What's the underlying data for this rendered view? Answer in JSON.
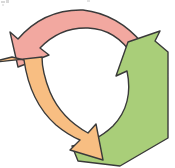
{
  "figure": {
    "type": "cycle-diagram",
    "background_color": "#ffffff",
    "outline_color": "#3a3a3a",
    "outline_width": 1.4,
    "rotation_direction": "counter-clockwise",
    "center": {
      "x": 88,
      "y": 85
    },
    "inner_radius": 48,
    "outer_radius": 82,
    "arrow_count": 3,
    "labels_present": false,
    "cropped_edges": [
      "left"
    ]
  },
  "arrows": [
    {
      "name": "pink-arrow",
      "position": "top",
      "fill": "#f2a8a0",
      "stroke": "#3a3a3a",
      "arrowhead_direction": "down-left",
      "tail_position": "upper-right",
      "path": "M 163 84 L 150 36 L 143 44 Q 118 14 83 10 Q 44 9 18 39 L 10 32 L 18 67 L 49 55 L 40 48 Q 60 27 88 28 Q 116 29 133 56 L 124 63 Z"
    },
    {
      "name": "green-arrow",
      "position": "right",
      "fill": "#a9ce79",
      "stroke": "#3a3a3a",
      "arrowhead_direction": "up-left",
      "tail_position": "bottom-left",
      "path": "M 128 42 L 116 76 L 127 71 Q 134 104 113 126 Q 95 143 72 146 L 78 161 L 120 166 L 168 138 L 168 52 L 155 41 L 160 31 Z"
    },
    {
      "name": "orange-arrow",
      "position": "left",
      "fill": "#f8be82",
      "stroke": "#3a3a3a",
      "arrowhead_direction": "down-right",
      "tail_position": "upper-left",
      "path": "M -12 63 L 12 57 L 24 60 Q 30 102 56 125 Q 68 135 80 140 L 70 150 L 103 160 L 96 124 L 88 133 Q 61 118 50 92 Q 42 72 42 57 Z"
    }
  ],
  "artifacts": [
    {
      "name": "scan-artifact-a",
      "description": "cropped ink fragment, top-left"
    },
    {
      "name": "scan-artifact-b",
      "description": "cropped ink fragment, top-left"
    },
    {
      "name": "scan-artifact-c",
      "description": "faint speck, top-left"
    },
    {
      "name": "scan-artifact-d",
      "description": "faint speck, top-center"
    }
  ]
}
